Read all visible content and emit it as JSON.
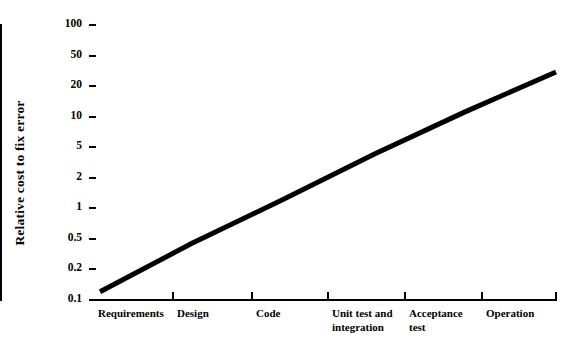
{
  "chart_data": {
    "type": "line",
    "title": "",
    "xlabel": "",
    "ylabel": "Relative cost to fix error",
    "log_y": true,
    "grid": false,
    "legend": null,
    "ylim": [
      0.1,
      100
    ],
    "y_ticks": [
      "100",
      "50",
      "20",
      "10",
      "5",
      "2",
      "1",
      "0.5",
      "0.2",
      "0.1"
    ],
    "y_tick_values": [
      100,
      50,
      20,
      10,
      5,
      2,
      1,
      0.5,
      0.2,
      0.1
    ],
    "categories": [
      "Requirements",
      "Design",
      "Code",
      "Unit test and\nintegration",
      "Acceptance\ntest",
      "Operation"
    ],
    "values": [
      0.12,
      0.4,
      1.2,
      3.8,
      11,
      30
    ],
    "series": [
      {
        "name": "Relative cost to fix error",
        "values": [
          0.12,
          0.4,
          1.2,
          3.8,
          11,
          30
        ],
        "color": "#000000"
      }
    ],
    "annotations": []
  },
  "axes": {
    "y_title": "Relative cost to fix error",
    "y_labels": [
      "100",
      "50",
      "20",
      "10",
      "5",
      "2",
      "1",
      "0.5",
      "0.2",
      "0.1"
    ],
    "x_labels": [
      "Requirements",
      "Design",
      "Code",
      "Unit test and\nintegration",
      "Acceptance\ntest",
      "Operation"
    ]
  },
  "colors": {
    "background": "#ffffff",
    "axis": "#000000",
    "line": "#000000",
    "text": "#000000"
  }
}
